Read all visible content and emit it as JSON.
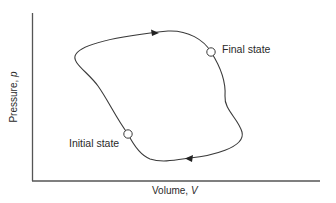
{
  "diagram": {
    "type": "pV-diagram-cyclic-process",
    "axes": {
      "x_label": "Volume,",
      "x_symbol": "V",
      "y_label": "Pressure,",
      "y_symbol": "p"
    },
    "states": {
      "initial": {
        "label": "Initial state"
      },
      "final": {
        "label": "Final state"
      }
    },
    "path": {
      "description": "Closed clockwise loop from initial state up-left, across top to final state, down right side, back along bottom to initial state",
      "arrows": [
        "top-segment-rightward",
        "bottom-segment-leftward"
      ]
    },
    "colors": {
      "line": "#3a3a3a",
      "axis": "#555555",
      "text": "#2a2a2a",
      "background": "#ffffff"
    }
  }
}
